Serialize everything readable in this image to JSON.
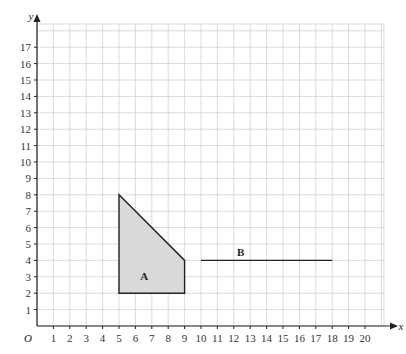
{
  "diagram": {
    "type": "coordinate-grid",
    "origin_label": "O",
    "x_axis": {
      "label": "x",
      "ticks": [
        "1",
        "2",
        "3",
        "4",
        "5",
        "6",
        "7",
        "8",
        "9",
        "10",
        "11",
        "12",
        "13",
        "14",
        "15",
        "16",
        "17",
        "18",
        "19",
        "20"
      ]
    },
    "y_axis": {
      "label": "y",
      "ticks": [
        "1",
        "2",
        "3",
        "4",
        "5",
        "6",
        "7",
        "8",
        "9",
        "10",
        "11",
        "12",
        "13",
        "14",
        "15",
        "16",
        "17"
      ]
    },
    "shapes": [
      {
        "name": "A",
        "label": "A",
        "kind": "polygon",
        "vertices": [
          [
            5,
            2
          ],
          [
            5,
            8
          ],
          [
            9,
            4
          ],
          [
            9,
            2
          ]
        ],
        "fill": "#d9d9d9",
        "stroke": "#222222"
      },
      {
        "name": "B",
        "label": "B",
        "kind": "line",
        "from": [
          10,
          4
        ],
        "to": [
          18,
          4
        ],
        "stroke": "#222222"
      }
    ],
    "colors": {
      "grid": "#d0d0d0",
      "axis": "#222222",
      "shape_fill": "#d9d9d9"
    }
  }
}
